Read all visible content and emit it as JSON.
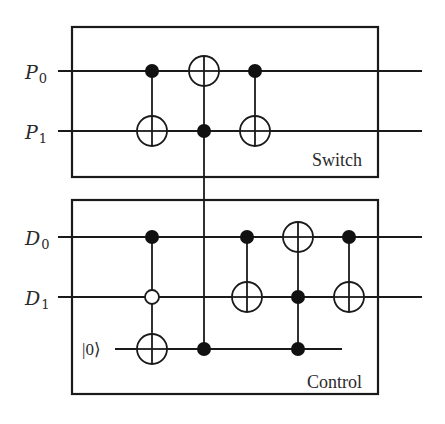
{
  "diagram": {
    "type": "quantum-circuit",
    "blocks": [
      {
        "id": "switch",
        "label": "Switch",
        "x": 72,
        "y": 27,
        "width": 306,
        "height": 150
      },
      {
        "id": "control",
        "label": "Control",
        "x": 72,
        "y": 200,
        "width": 306,
        "height": 194
      }
    ],
    "qubits": [
      {
        "id": "P0",
        "letter": "P",
        "sub": "0",
        "y": 71,
        "x_start": 58,
        "x_end": 422
      },
      {
        "id": "P1",
        "letter": "P",
        "sub": "1",
        "y": 131,
        "x_start": 58,
        "x_end": 422
      },
      {
        "id": "D0",
        "letter": "D",
        "sub": "0",
        "y": 237,
        "x_start": 58,
        "x_end": 422
      },
      {
        "id": "D1",
        "letter": "D",
        "sub": "1",
        "y": 297,
        "x_start": 58,
        "x_end": 422
      },
      {
        "id": "ancilla",
        "ket": "|0⟩",
        "y": 349,
        "x_start": 115,
        "x_end": 342
      }
    ],
    "gates": [
      {
        "name": "CNOT P0→P1",
        "x": 152,
        "controls": [
          "P0"
        ],
        "open_controls": [],
        "target": "P1"
      },
      {
        "name": "CNOT P1→P0",
        "x": 204,
        "controls": [
          "P1"
        ],
        "open_controls": [],
        "target": "P0"
      },
      {
        "name": "CNOT P0→P1",
        "x": 255,
        "controls": [
          "P0"
        ],
        "open_controls": [],
        "target": "P1"
      },
      {
        "name": "Toffoli D0,¬D1→anc",
        "x": 152,
        "controls": [
          "D0"
        ],
        "open_controls": [
          "D1"
        ],
        "target": "ancilla"
      },
      {
        "name": "Controlled link P1–anc",
        "x": 204,
        "controls": [
          "P1",
          "ancilla"
        ],
        "open_controls": [],
        "target": null
      },
      {
        "name": "CNOT D0→D1",
        "x": 247,
        "controls": [
          "D0"
        ],
        "open_controls": [],
        "target": "D1"
      },
      {
        "name": "Toffoli D1,anc→D0",
        "x": 298,
        "controls": [
          "D1",
          "ancilla"
        ],
        "open_controls": [],
        "target": "D0"
      },
      {
        "name": "CNOT D0→D1",
        "x": 349,
        "controls": [
          "D0"
        ],
        "open_controls": [],
        "target": "D1"
      }
    ],
    "colors": {
      "ink": "#1a1a1a",
      "background": "#ffffff"
    }
  },
  "labels": {
    "p0_letter": "P",
    "p0_sub": "0",
    "p1_letter": "P",
    "p1_sub": "1",
    "d0_letter": "D",
    "d0_sub": "0",
    "d1_letter": "D",
    "d1_sub": "1",
    "ancilla_ket": "|0⟩",
    "switch_block": "Switch",
    "control_block": "Control"
  }
}
